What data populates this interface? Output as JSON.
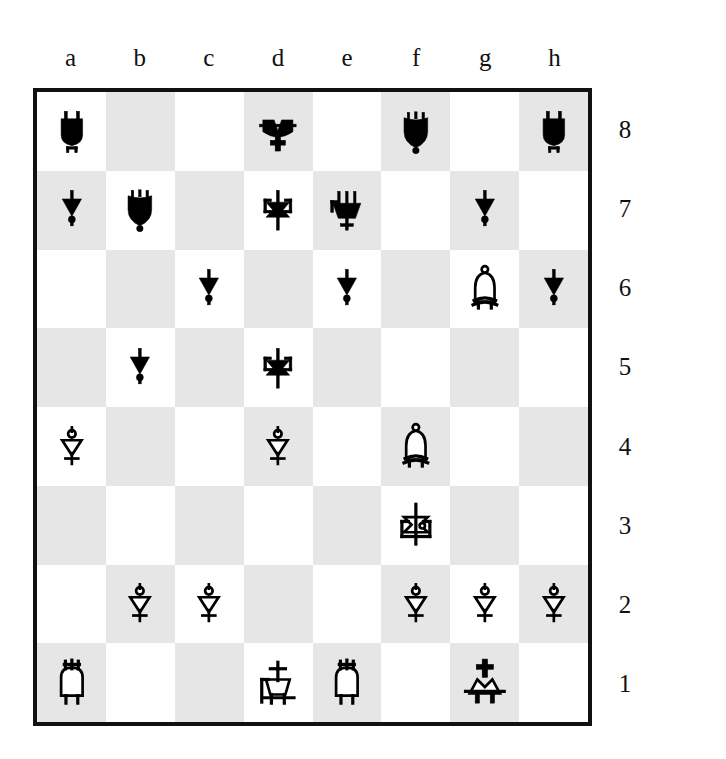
{
  "board": {
    "orientation": "white-bottom",
    "files": [
      "a",
      "b",
      "c",
      "d",
      "e",
      "f",
      "g",
      "h"
    ],
    "ranks": [
      "8",
      "7",
      "6",
      "5",
      "4",
      "3",
      "2",
      "1"
    ],
    "colors": {
      "light_square": "#ffffff",
      "dark_square": "#e6e6e6",
      "border": "#111111",
      "piece_black": "#000000",
      "piece_white_fill": "#ffffff",
      "piece_white_outline": "#000000",
      "label_text": "#111111"
    },
    "piece_glyph_names": {
      "bk": "black-king-icon",
      "bq": "black-queen-icon",
      "br": "black-rook-icon",
      "bb": "black-bishop-icon",
      "bn": "black-knight-icon",
      "bp": "black-pawn-icon",
      "wk": "white-king-icon",
      "wq": "white-queen-icon",
      "wr": "white-rook-icon",
      "wb": "white-bishop-icon",
      "wn": "white-knight-icon",
      "wp": "white-pawn-icon"
    },
    "ranks_data": [
      {
        "rank": "8",
        "squares": [
          {
            "square": "a8",
            "shade": "light",
            "piece": "br",
            "piece_label": "black rook"
          },
          {
            "square": "b8",
            "shade": "dark",
            "piece": null,
            "piece_label": ""
          },
          {
            "square": "c8",
            "shade": "light",
            "piece": null,
            "piece_label": ""
          },
          {
            "square": "d8",
            "shade": "dark",
            "piece": "bk",
            "piece_label": "black king"
          },
          {
            "square": "e8",
            "shade": "light",
            "piece": null,
            "piece_label": ""
          },
          {
            "square": "f8",
            "shade": "dark",
            "piece": "bb",
            "piece_label": "black bishop"
          },
          {
            "square": "g8",
            "shade": "light",
            "piece": null,
            "piece_label": ""
          },
          {
            "square": "h8",
            "shade": "dark",
            "piece": "br",
            "piece_label": "black rook"
          }
        ]
      },
      {
        "rank": "7",
        "squares": [
          {
            "square": "a7",
            "shade": "dark",
            "piece": "bp",
            "piece_label": "black pawn"
          },
          {
            "square": "b7",
            "shade": "light",
            "piece": "bb",
            "piece_label": "black bishop"
          },
          {
            "square": "c7",
            "shade": "dark",
            "piece": null,
            "piece_label": ""
          },
          {
            "square": "d7",
            "shade": "light",
            "piece": "bn",
            "piece_label": "black knight"
          },
          {
            "square": "e7",
            "shade": "dark",
            "piece": "bq",
            "piece_label": "black queen"
          },
          {
            "square": "f7",
            "shade": "light",
            "piece": null,
            "piece_label": ""
          },
          {
            "square": "g7",
            "shade": "dark",
            "piece": "bp",
            "piece_label": "black pawn"
          },
          {
            "square": "h7",
            "shade": "light",
            "piece": null,
            "piece_label": ""
          }
        ]
      },
      {
        "rank": "6",
        "squares": [
          {
            "square": "a6",
            "shade": "light",
            "piece": null,
            "piece_label": ""
          },
          {
            "square": "b6",
            "shade": "dark",
            "piece": null,
            "piece_label": ""
          },
          {
            "square": "c6",
            "shade": "light",
            "piece": "bp",
            "piece_label": "black pawn"
          },
          {
            "square": "d6",
            "shade": "dark",
            "piece": null,
            "piece_label": ""
          },
          {
            "square": "e6",
            "shade": "light",
            "piece": "bp",
            "piece_label": "black pawn"
          },
          {
            "square": "f6",
            "shade": "dark",
            "piece": null,
            "piece_label": ""
          },
          {
            "square": "g6",
            "shade": "light",
            "piece": "wb",
            "piece_label": "white bishop"
          },
          {
            "square": "h6",
            "shade": "dark",
            "piece": "bp",
            "piece_label": "black pawn"
          }
        ]
      },
      {
        "rank": "5",
        "squares": [
          {
            "square": "a5",
            "shade": "dark",
            "piece": null,
            "piece_label": ""
          },
          {
            "square": "b5",
            "shade": "light",
            "piece": "bp",
            "piece_label": "black pawn"
          },
          {
            "square": "c5",
            "shade": "dark",
            "piece": null,
            "piece_label": ""
          },
          {
            "square": "d5",
            "shade": "light",
            "piece": "bn",
            "piece_label": "black knight"
          },
          {
            "square": "e5",
            "shade": "dark",
            "piece": null,
            "piece_label": ""
          },
          {
            "square": "f5",
            "shade": "light",
            "piece": null,
            "piece_label": ""
          },
          {
            "square": "g5",
            "shade": "dark",
            "piece": null,
            "piece_label": ""
          },
          {
            "square": "h5",
            "shade": "light",
            "piece": null,
            "piece_label": ""
          }
        ]
      },
      {
        "rank": "4",
        "squares": [
          {
            "square": "a4",
            "shade": "light",
            "piece": "wp",
            "piece_label": "white pawn"
          },
          {
            "square": "b4",
            "shade": "dark",
            "piece": null,
            "piece_label": ""
          },
          {
            "square": "c4",
            "shade": "light",
            "piece": null,
            "piece_label": ""
          },
          {
            "square": "d4",
            "shade": "dark",
            "piece": "wp",
            "piece_label": "white pawn"
          },
          {
            "square": "e4",
            "shade": "light",
            "piece": null,
            "piece_label": ""
          },
          {
            "square": "f4",
            "shade": "dark",
            "piece": "wb",
            "piece_label": "white bishop"
          },
          {
            "square": "g4",
            "shade": "light",
            "piece": null,
            "piece_label": ""
          },
          {
            "square": "h4",
            "shade": "dark",
            "piece": null,
            "piece_label": ""
          }
        ]
      },
      {
        "rank": "3",
        "squares": [
          {
            "square": "a3",
            "shade": "dark",
            "piece": null,
            "piece_label": ""
          },
          {
            "square": "b3",
            "shade": "light",
            "piece": null,
            "piece_label": ""
          },
          {
            "square": "c3",
            "shade": "dark",
            "piece": null,
            "piece_label": ""
          },
          {
            "square": "d3",
            "shade": "light",
            "piece": null,
            "piece_label": ""
          },
          {
            "square": "e3",
            "shade": "dark",
            "piece": null,
            "piece_label": ""
          },
          {
            "square": "f3",
            "shade": "light",
            "piece": "wn",
            "piece_label": "white knight"
          },
          {
            "square": "g3",
            "shade": "dark",
            "piece": null,
            "piece_label": ""
          },
          {
            "square": "h3",
            "shade": "light",
            "piece": null,
            "piece_label": ""
          }
        ]
      },
      {
        "rank": "2",
        "squares": [
          {
            "square": "a2",
            "shade": "light",
            "piece": null,
            "piece_label": ""
          },
          {
            "square": "b2",
            "shade": "dark",
            "piece": "wp",
            "piece_label": "white pawn"
          },
          {
            "square": "c2",
            "shade": "light",
            "piece": "wp",
            "piece_label": "white pawn"
          },
          {
            "square": "d2",
            "shade": "dark",
            "piece": null,
            "piece_label": ""
          },
          {
            "square": "e2",
            "shade": "light",
            "piece": null,
            "piece_label": ""
          },
          {
            "square": "f2",
            "shade": "dark",
            "piece": "wp",
            "piece_label": "white pawn"
          },
          {
            "square": "g2",
            "shade": "light",
            "piece": "wp",
            "piece_label": "white pawn"
          },
          {
            "square": "h2",
            "shade": "dark",
            "piece": "wp",
            "piece_label": "white pawn"
          }
        ]
      },
      {
        "rank": "1",
        "squares": [
          {
            "square": "a1",
            "shade": "dark",
            "piece": "wr",
            "piece_label": "white rook"
          },
          {
            "square": "b1",
            "shade": "light",
            "piece": null,
            "piece_label": ""
          },
          {
            "square": "c1",
            "shade": "dark",
            "piece": null,
            "piece_label": ""
          },
          {
            "square": "d1",
            "shade": "light",
            "piece": "wq",
            "piece_label": "white queen"
          },
          {
            "square": "e1",
            "shade": "dark",
            "piece": "wr",
            "piece_label": "white rook"
          },
          {
            "square": "f1",
            "shade": "light",
            "piece": null,
            "piece_label": ""
          },
          {
            "square": "g1",
            "shade": "dark",
            "piece": "wk",
            "piece_label": "white king"
          },
          {
            "square": "h1",
            "shade": "light",
            "piece": null,
            "piece_label": ""
          }
        ]
      }
    ]
  }
}
